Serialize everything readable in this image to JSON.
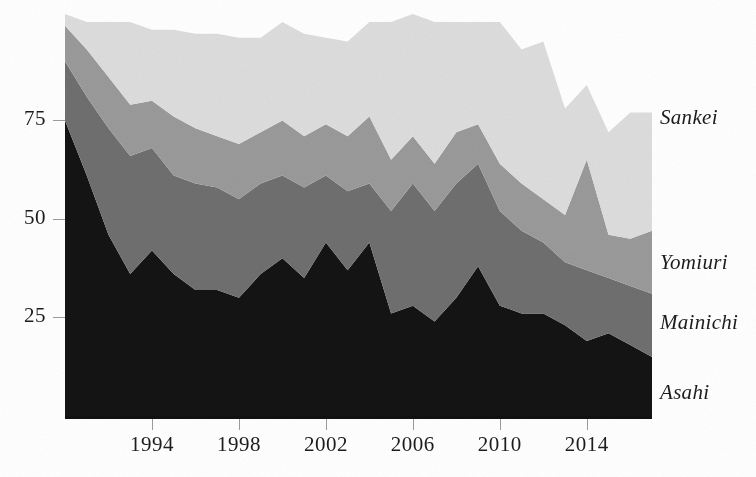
{
  "chart_data": {
    "type": "area",
    "stacked": true,
    "title": "",
    "subtitle": "",
    "xlabel": "",
    "ylabel": "",
    "grid": false,
    "legend_position": "right-inline",
    "xlim": [
      1990,
      2017
    ],
    "ylim": [
      0,
      102
    ],
    "x_ticks": [
      1994,
      1998,
      2002,
      2006,
      2010,
      2014
    ],
    "x_tick_labels": [
      "1994",
      "1998",
      "2002",
      "2006",
      "2010",
      "2014"
    ],
    "y_ticks": [
      25,
      50,
      75
    ],
    "y_tick_labels": [
      "25",
      "50",
      "75"
    ],
    "x": [
      1990,
      1991,
      1992,
      1993,
      1994,
      1995,
      1996,
      1997,
      1998,
      1999,
      2000,
      2001,
      2002,
      2003,
      2004,
      2005,
      2006,
      2007,
      2008,
      2009,
      2010,
      2011,
      2012,
      2013,
      2014,
      2015,
      2016,
      2017
    ],
    "series": [
      {
        "name": "Asahi",
        "color": "#141414",
        "order": 1,
        "values": [
          75,
          61,
          46,
          36,
          42,
          36,
          32,
          32,
          30,
          36,
          40,
          35,
          44,
          37,
          44,
          26,
          28,
          24,
          30,
          38,
          28,
          26,
          26,
          23,
          19,
          21,
          18,
          15
        ]
      },
      {
        "name": "Mainichi",
        "color": "#6f6f6f",
        "order": 2,
        "values": [
          15,
          20,
          27,
          30,
          26,
          25,
          27,
          26,
          25,
          23,
          21,
          23,
          17,
          20,
          15,
          26,
          31,
          28,
          29,
          26,
          24,
          21,
          18,
          16,
          18,
          14,
          15,
          16
        ]
      },
      {
        "name": "Yomiuri",
        "color": "#9a9a9a",
        "order": 3,
        "values": [
          9,
          12,
          13,
          13,
          12,
          15,
          14,
          13,
          14,
          13,
          14,
          13,
          13,
          14,
          17,
          13,
          12,
          12,
          13,
          10,
          12,
          12,
          11,
          12,
          28,
          11,
          12,
          16
        ]
      },
      {
        "name": "Sankei",
        "color": "#dddddd",
        "order": 4,
        "values": [
          3,
          7,
          14,
          21,
          18,
          22,
          24,
          26,
          27,
          24,
          25,
          26,
          22,
          24,
          24,
          35,
          31,
          36,
          28,
          26,
          36,
          34,
          40,
          27,
          19,
          26,
          32,
          30
        ]
      }
    ]
  },
  "series_labels": [
    {
      "name": "Sankei",
      "text": "Sankei",
      "y": 105
    },
    {
      "name": "Yomiuri",
      "text": "Yomiuri",
      "y": 250
    },
    {
      "name": "Mainichi",
      "text": "Mainichi",
      "y": 310
    },
    {
      "name": "Asahi",
      "text": "Asahi",
      "y": 380
    }
  ],
  "colors": {
    "asahi": "#141414",
    "mainichi": "#6f6f6f",
    "yomiuri": "#9a9a9a",
    "sankei": "#dddddd",
    "axis": "#1c1c1c",
    "background": "#ffffff"
  }
}
